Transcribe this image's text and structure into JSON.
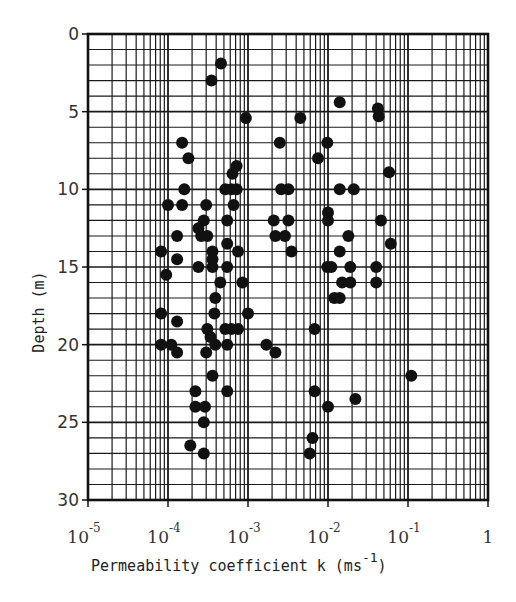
{
  "chart_data": {
    "type": "scatter",
    "title": "",
    "xlabel": "Permeability coefficient k (ms^-1)",
    "xlabel_parts": {
      "main": "Permeability coefficient k (ms",
      "sup": "-1",
      "close": ")"
    },
    "ylabel": "Depth (m)",
    "xscale": "log",
    "xlim": [
      1e-05,
      1
    ],
    "ylim": [
      30,
      0
    ],
    "y_inverted": true,
    "grid": true,
    "legend": null,
    "x_ticks": [
      {
        "value": 1e-05,
        "base": "10",
        "exp": "-5"
      },
      {
        "value": 0.0001,
        "base": "10",
        "exp": "-4"
      },
      {
        "value": 0.001,
        "base": "10",
        "exp": "-3"
      },
      {
        "value": 0.01,
        "base": "10",
        "exp": "-2"
      },
      {
        "value": 0.1,
        "base": "10",
        "exp": "-1"
      },
      {
        "value": 1,
        "base": "1",
        "exp": ""
      }
    ],
    "y_ticks": [
      0,
      5,
      10,
      15,
      20,
      25,
      30
    ],
    "marker": {
      "shape": "circle",
      "fill": "#111111",
      "radius": 6
    },
    "points": [
      {
        "k": 0.00046,
        "depth": 1.9
      },
      {
        "k": 0.00035,
        "depth": 3.0
      },
      {
        "k": 0.00094,
        "depth": 5.4
      },
      {
        "k": 0.0045,
        "depth": 5.4
      },
      {
        "k": 0.014,
        "depth": 4.4
      },
      {
        "k": 0.042,
        "depth": 4.8
      },
      {
        "k": 0.043,
        "depth": 5.3
      },
      {
        "k": 0.00015,
        "depth": 7.0
      },
      {
        "k": 0.00018,
        "depth": 8.0
      },
      {
        "k": 0.00072,
        "depth": 8.5
      },
      {
        "k": 0.00064,
        "depth": 9.0
      },
      {
        "k": 0.0025,
        "depth": 7.0
      },
      {
        "k": 0.0075,
        "depth": 8.0
      },
      {
        "k": 0.0098,
        "depth": 7.0
      },
      {
        "k": 0.058,
        "depth": 8.9
      },
      {
        "k": 0.00016,
        "depth": 10.0
      },
      {
        "k": 0.00052,
        "depth": 10.0
      },
      {
        "k": 0.00062,
        "depth": 10.0
      },
      {
        "k": 0.00072,
        "depth": 10.0
      },
      {
        "k": 0.0026,
        "depth": 10.0
      },
      {
        "k": 0.0032,
        "depth": 10.0
      },
      {
        "k": 0.014,
        "depth": 10.0
      },
      {
        "k": 0.021,
        "depth": 10.0
      },
      {
        "k": 0.00015,
        "depth": 11.0
      },
      {
        "k": 0.0003,
        "depth": 11.0
      },
      {
        "k": 0.0001,
        "depth": 11.0
      },
      {
        "k": 0.00066,
        "depth": 11.0
      },
      {
        "k": 0.01,
        "depth": 11.5
      },
      {
        "k": 0.00028,
        "depth": 12.0
      },
      {
        "k": 0.00055,
        "depth": 12.0
      },
      {
        "k": 0.0021,
        "depth": 12.0
      },
      {
        "k": 0.0032,
        "depth": 12.0
      },
      {
        "k": 0.01,
        "depth": 12.0
      },
      {
        "k": 0.046,
        "depth": 12.0
      },
      {
        "k": 0.00024,
        "depth": 12.5
      },
      {
        "k": 0.00013,
        "depth": 13.0
      },
      {
        "k": 0.00026,
        "depth": 13.0
      },
      {
        "k": 0.00031,
        "depth": 13.0
      },
      {
        "k": 0.0022,
        "depth": 13.0
      },
      {
        "k": 0.0029,
        "depth": 13.0
      },
      {
        "k": 0.018,
        "depth": 13.0
      },
      {
        "k": 0.061,
        "depth": 13.5
      },
      {
        "k": 0.00055,
        "depth": 13.5
      },
      {
        "k": 0.00036,
        "depth": 14.0
      },
      {
        "k": 0.00075,
        "depth": 14.0
      },
      {
        "k": 8.2e-05,
        "depth": 14.0
      },
      {
        "k": 0.0035,
        "depth": 14.0
      },
      {
        "k": 0.014,
        "depth": 14.0
      },
      {
        "k": 0.00013,
        "depth": 14.5
      },
      {
        "k": 0.00036,
        "depth": 14.5
      },
      {
        "k": 0.00024,
        "depth": 15.0
      },
      {
        "k": 0.00036,
        "depth": 15.0
      },
      {
        "k": 0.00055,
        "depth": 15.0
      },
      {
        "k": 0.0098,
        "depth": 15.0
      },
      {
        "k": 0.011,
        "depth": 15.0
      },
      {
        "k": 0.019,
        "depth": 15.0
      },
      {
        "k": 0.04,
        "depth": 15.0
      },
      {
        "k": 9.5e-05,
        "depth": 15.5
      },
      {
        "k": 0.00045,
        "depth": 16.0
      },
      {
        "k": 0.00085,
        "depth": 16.0
      },
      {
        "k": 0.015,
        "depth": 16.0
      },
      {
        "k": 0.019,
        "depth": 16.0
      },
      {
        "k": 0.04,
        "depth": 16.0
      },
      {
        "k": 0.00039,
        "depth": 17.0
      },
      {
        "k": 0.012,
        "depth": 17.0
      },
      {
        "k": 0.014,
        "depth": 17.0
      },
      {
        "k": 0.00038,
        "depth": 18.0
      },
      {
        "k": 8.2e-05,
        "depth": 18.0
      },
      {
        "k": 0.001,
        "depth": 18.0
      },
      {
        "k": 0.00013,
        "depth": 18.5
      },
      {
        "k": 0.00031,
        "depth": 19.0
      },
      {
        "k": 0.00052,
        "depth": 19.0
      },
      {
        "k": 0.00062,
        "depth": 19.0
      },
      {
        "k": 0.00075,
        "depth": 19.0
      },
      {
        "k": 0.0068,
        "depth": 19.0
      },
      {
        "k": 0.00034,
        "depth": 19.5
      },
      {
        "k": 0.00039,
        "depth": 20.0
      },
      {
        "k": 8.2e-05,
        "depth": 20.0
      },
      {
        "k": 0.00011,
        "depth": 20.0
      },
      {
        "k": 0.00055,
        "depth": 20.0
      },
      {
        "k": 0.0017,
        "depth": 20.0
      },
      {
        "k": 0.00013,
        "depth": 20.5
      },
      {
        "k": 0.0003,
        "depth": 20.5
      },
      {
        "k": 0.0022,
        "depth": 20.5
      },
      {
        "k": 0.00036,
        "depth": 22.0
      },
      {
        "k": 0.11,
        "depth": 22.0
      },
      {
        "k": 0.00022,
        "depth": 23.0
      },
      {
        "k": 0.00055,
        "depth": 23.0
      },
      {
        "k": 0.0068,
        "depth": 23.0
      },
      {
        "k": 0.022,
        "depth": 23.5
      },
      {
        "k": 0.00022,
        "depth": 24.0
      },
      {
        "k": 0.00029,
        "depth": 24.0
      },
      {
        "k": 0.01,
        "depth": 24.0
      },
      {
        "k": 0.00028,
        "depth": 25.0
      },
      {
        "k": 0.00019,
        "depth": 26.5
      },
      {
        "k": 0.0064,
        "depth": 26.0
      },
      {
        "k": 0.0059,
        "depth": 27.0
      },
      {
        "k": 0.00028,
        "depth": 27.0
      }
    ]
  },
  "layout": {
    "plot_left": 88,
    "plot_top": 34,
    "plot_right": 488,
    "plot_bottom": 500,
    "frame_color": "#111111",
    "grid_color": "#1a1a1a"
  }
}
